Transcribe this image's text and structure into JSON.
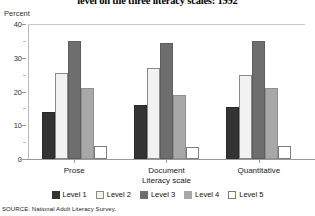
{
  "title": "level on the three literacy scales: 1992",
  "y_axis_title": "Percent",
  "source_note": "SOURCE: National Adult Literacy Survey.",
  "axis": {
    "ticks": [
      "0",
      "10",
      "20",
      "30",
      "40"
    ],
    "minor_ticks": [
      "5",
      "15",
      "25",
      "35"
    ]
  },
  "legend": {
    "items": [
      {
        "label": "Level 1",
        "color": "#333333"
      },
      {
        "label": "Level 2",
        "color": "#f2f2f2"
      },
      {
        "label": "Level 3",
        "color": "#6e6e6e"
      },
      {
        "label": "Level 4",
        "color": "#a8a8a8"
      },
      {
        "label": "Level 5",
        "color": "#ffffff"
      }
    ]
  },
  "chart_data": {
    "type": "bar",
    "title": "level on the three literacy scales: 1992",
    "xlabel": "Literacy scale",
    "ylabel": "Percent",
    "ylim": [
      0,
      40
    ],
    "grid": false,
    "legend_position": "bottom",
    "categories": [
      "Prose",
      "Document",
      "Quantitative"
    ],
    "series": [
      {
        "name": "Level 1",
        "values": [
          14,
          16,
          15.5
        ]
      },
      {
        "name": "Level 2",
        "values": [
          25.5,
          27,
          25
        ]
      },
      {
        "name": "Level 3",
        "values": [
          35,
          34.5,
          35
        ]
      },
      {
        "name": "Level 4",
        "values": [
          21,
          19,
          21
        ]
      },
      {
        "name": "Level 5",
        "values": [
          4,
          3.5,
          4
        ]
      }
    ],
    "source": "SOURCE: National Adult Literacy Survey."
  }
}
